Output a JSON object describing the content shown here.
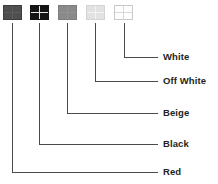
{
  "diagram": {
    "type": "callout-label-diagram",
    "background_color": "#ffffff",
    "line_color": "#4a4a4a",
    "text_color": "#231f20",
    "items": [
      {
        "id": "red",
        "label": "Red",
        "swatch_color": "#4f4f4f",
        "swatch_grid_color": "#5c5c5c",
        "swatch_border_color": "#3d3d3d",
        "swatch_x": 3,
        "swatch_y": 5,
        "line_x": 12,
        "line_y": 172
      },
      {
        "id": "black",
        "label": "Black",
        "swatch_color": "#151515",
        "swatch_grid_color": "#e8e8e8",
        "swatch_border_color": "#151515",
        "swatch_x": 30,
        "swatch_y": 5,
        "line_x": 39,
        "line_y": 144
      },
      {
        "id": "beige",
        "label": "Beige",
        "swatch_color": "#8a8a8a",
        "swatch_grid_color": "#939393",
        "swatch_border_color": "#7d7d7d",
        "swatch_x": 58,
        "swatch_y": 5,
        "line_x": 67,
        "line_y": 113
      },
      {
        "id": "off-white",
        "label": "Off White",
        "swatch_color": "#e2e2e2",
        "swatch_grid_color": "#f2f2f2",
        "swatch_border_color": "#d4d4d4",
        "swatch_x": 86,
        "swatch_y": 5,
        "line_x": 95,
        "line_y": 81
      },
      {
        "id": "white",
        "label": "White",
        "swatch_color": "#fdfdfd",
        "swatch_grid_color": "#d9d9d9",
        "swatch_border_color": "#c9c9c9",
        "swatch_x": 114,
        "swatch_y": 5,
        "line_x": 124,
        "line_y": 57
      }
    ],
    "line_end_x": 158,
    "label_x": 163
  }
}
